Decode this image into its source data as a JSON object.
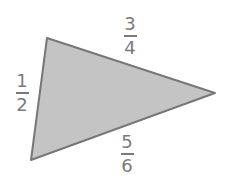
{
  "diagram": {
    "shape": "triangle",
    "fill_color": "#c4c4c4",
    "stroke_color": "#777777",
    "vertices": [
      [
        47,
        38
      ],
      [
        215,
        93
      ],
      [
        31,
        160
      ]
    ],
    "sides": [
      {
        "position": "top",
        "numerator": "3",
        "denominator": "4"
      },
      {
        "position": "left",
        "numerator": "1",
        "denominator": "2"
      },
      {
        "position": "bottom",
        "numerator": "5",
        "denominator": "6"
      }
    ]
  }
}
